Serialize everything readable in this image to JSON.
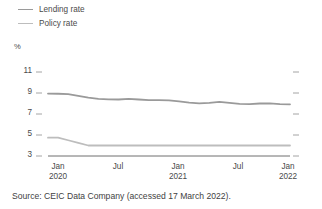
{
  "legend": {
    "position": "top-left",
    "items": [
      {
        "label": "Lending rate",
        "color": "#9a9a9a",
        "icon": "line-swatch-icon"
      },
      {
        "label": "Policy rate",
        "color": "#bdbdbd",
        "icon": "line-swatch-icon"
      }
    ]
  },
  "axis_unit_label": "%",
  "source_note": "Source: CEIC Data Company (accessed 17 March 2022).",
  "colors": {
    "lending_rate": "#9a9a9a",
    "policy_rate": "#bdbdbd",
    "axis": "#6f6f6f",
    "text": "#4a4a4a"
  },
  "chart_data": {
    "type": "line",
    "title": "",
    "xlabel": "",
    "ylabel": "%",
    "ylim": [
      3,
      12
    ],
    "yticks": [
      3,
      5,
      7,
      9,
      11
    ],
    "grid": false,
    "legend_position": "top-left",
    "xtick_labels": [
      {
        "month": "Jan",
        "year": "2020"
      },
      {
        "month": "Jul",
        "year": ""
      },
      {
        "month": "Jan",
        "year": "2021"
      },
      {
        "month": "Jul",
        "year": ""
      },
      {
        "month": "Jan",
        "year": "2022"
      }
    ],
    "x": [
      "2020-01",
      "2020-02",
      "2020-03",
      "2020-04",
      "2020-05",
      "2020-06",
      "2020-07",
      "2020-08",
      "2020-09",
      "2020-10",
      "2020-11",
      "2020-12",
      "2021-01",
      "2021-02",
      "2021-03",
      "2021-04",
      "2021-05",
      "2021-06",
      "2021-07",
      "2021-08",
      "2021-09",
      "2021-10",
      "2021-11",
      "2021-12",
      "2022-01"
    ],
    "series": [
      {
        "name": "Lending rate",
        "color": "#9a9a9a",
        "values": [
          8.95,
          8.93,
          8.9,
          8.72,
          8.55,
          8.45,
          8.4,
          8.38,
          8.44,
          8.38,
          8.33,
          8.32,
          8.3,
          8.2,
          8.08,
          8.02,
          8.06,
          8.16,
          8.06,
          7.96,
          7.95,
          8.0,
          8.02,
          7.94,
          7.92
        ]
      },
      {
        "name": "Policy rate",
        "color": "#bdbdbd",
        "values": [
          4.75,
          4.75,
          4.5,
          4.25,
          4.0,
          4.0,
          4.0,
          4.0,
          4.0,
          4.0,
          4.0,
          4.0,
          4.0,
          4.0,
          4.0,
          4.0,
          4.0,
          4.0,
          4.0,
          4.0,
          4.0,
          4.0,
          4.0,
          4.0,
          4.0
        ]
      }
    ]
  }
}
